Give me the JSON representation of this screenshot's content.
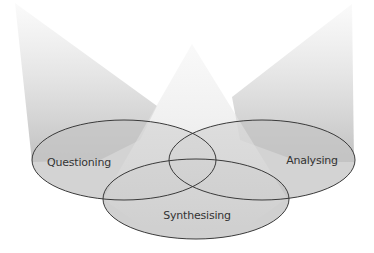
{
  "diagram": {
    "type": "venn-spotlight",
    "colors": {
      "background": "#ffffff",
      "beam_top": "#f7f7f7",
      "beam_bottom": "#c2c2c2",
      "ellipse_fill": "#c6c6c6",
      "outline": "#3a3a3a",
      "label": "#333333"
    },
    "circles": [
      {
        "id": "questioning",
        "label": "Questioning",
        "cx": 124,
        "cy": 160,
        "rx": 92,
        "ry": 40,
        "label_x": 79,
        "label_y": 166
      },
      {
        "id": "analysing",
        "label": "Analysing",
        "cx": 262,
        "cy": 160,
        "rx": 93,
        "ry": 40,
        "label_x": 312,
        "label_y": 164
      },
      {
        "id": "synthesising",
        "label": "Synthesising",
        "cx": 196,
        "cy": 199,
        "rx": 93,
        "ry": 40,
        "label_x": 197,
        "label_y": 219
      }
    ],
    "beams": [
      {
        "id": "left-beam",
        "points": "15,3 155,107 124,160 32,160"
      },
      {
        "id": "center-beam",
        "points": "192,44 285,199 196,239 103,199"
      },
      {
        "id": "right-beam",
        "points": "352,5 352,160 262,160 232,97"
      }
    ]
  }
}
